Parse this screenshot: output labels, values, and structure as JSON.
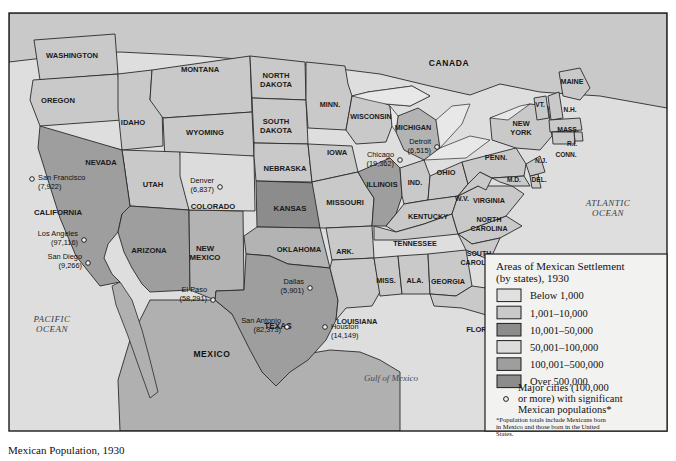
{
  "figure": {
    "caption": "Mexican Population, 1930",
    "bg_color": "#ffffff",
    "map_border_color": "#1d1d1d"
  },
  "map": {
    "countries": [
      {
        "name": "canada",
        "label": "CANADA",
        "x": 449,
        "y": 66,
        "size": 8.5
      },
      {
        "name": "mexico",
        "label": "MEXICO",
        "x": 212,
        "y": 357,
        "size": 8.5
      }
    ],
    "oceans": [
      {
        "name": "pacific-ocean",
        "line1": "PACIFIC",
        "line2": "OCEAN",
        "x": 52,
        "y": 322
      },
      {
        "name": "atlantic-ocean",
        "line1": "ATLANTIC",
        "line2": "OCEAN",
        "x": 608,
        "y": 206
      },
      {
        "name": "gulf-of-mexico",
        "line1": "Gulf of Mexico",
        "line2": "",
        "x": 391,
        "y": 381
      }
    ],
    "states": [
      {
        "id": "WA",
        "label": "WASHINGTON",
        "x": 72,
        "y": 56,
        "size": 7.6,
        "fill": "#c9c9c9",
        "lines": 1
      },
      {
        "id": "OR",
        "label": "OREGON",
        "x": 58,
        "y": 101,
        "size": 7.6,
        "fill": "#c9c9c9",
        "lines": 1
      },
      {
        "id": "ID",
        "label": "IDAHO",
        "x": 133,
        "y": 123,
        "size": 7.6,
        "fill": "#c9c9c9",
        "lines": 1
      },
      {
        "id": "MT",
        "label": "MONTANA",
        "x": 200,
        "y": 70,
        "size": 7.6,
        "fill": "#c9c9c9",
        "lines": 1
      },
      {
        "id": "WY",
        "label": "WYOMING",
        "x": 205,
        "y": 133,
        "size": 7.6,
        "fill": "#c9c9c9",
        "lines": 1
      },
      {
        "id": "NV",
        "label": "NEVADA",
        "x": 101,
        "y": 163,
        "size": 7.6,
        "fill": "#c9c9c9",
        "lines": 1
      },
      {
        "id": "UT",
        "label": "UTAH",
        "x": 153,
        "y": 185,
        "size": 7.6,
        "fill": "#c9c9c9",
        "lines": 1
      },
      {
        "id": "CA",
        "label": "CALIFORNIA",
        "x": 58,
        "y": 213,
        "size": 7.8,
        "fill": "#9e9e9e",
        "lines": 1
      },
      {
        "id": "AZ",
        "label": "ARIZONA",
        "x": 149,
        "y": 251,
        "size": 7.8,
        "fill": "#9e9e9e",
        "lines": 1
      },
      {
        "id": "NM",
        "label": "NEW\nMEXICO",
        "x": 205,
        "y": 253,
        "size": 7.8,
        "fill": "#b3b3b3",
        "lines": 2
      },
      {
        "id": "CO",
        "label": "COLORADO",
        "x": 213,
        "y": 207,
        "size": 7.6,
        "fill": "#dcdcdc",
        "lines": 1
      },
      {
        "id": "ND",
        "label": "NORTH\nDAKOTA",
        "x": 276,
        "y": 80,
        "size": 7.6,
        "fill": "#c9c9c9",
        "lines": 2
      },
      {
        "id": "SD",
        "label": "SOUTH\nDAKOTA",
        "x": 276,
        "y": 126,
        "size": 7.6,
        "fill": "#c9c9c9",
        "lines": 2
      },
      {
        "id": "NE",
        "label": "NEBRASKA",
        "x": 285,
        "y": 169,
        "size": 7.6,
        "fill": "#c9c9c9",
        "lines": 1
      },
      {
        "id": "KS",
        "label": "KANSAS",
        "x": 290,
        "y": 209,
        "size": 7.8,
        "fill": "#8c8c8c",
        "lines": 1
      },
      {
        "id": "OK",
        "label": "OKLAHOMA",
        "x": 299,
        "y": 250,
        "size": 7.6,
        "fill": "#b3b3b3",
        "lines": 1
      },
      {
        "id": "TX",
        "label": "TEXAS",
        "x": 278,
        "y": 327,
        "size": 8.2,
        "fill": "#9e9e9e",
        "lines": 1
      },
      {
        "id": "MN",
        "label": "MINN.",
        "x": 330,
        "y": 105,
        "size": 7.2,
        "fill": "#c9c9c9",
        "lines": 1
      },
      {
        "id": "IA",
        "label": "IOWA",
        "x": 337,
        "y": 153,
        "size": 7.6,
        "fill": "#c9c9c9",
        "lines": 1
      },
      {
        "id": "MO",
        "label": "MISSOURI",
        "x": 345,
        "y": 203,
        "size": 7.6,
        "fill": "#c9c9c9",
        "lines": 1
      },
      {
        "id": "AR",
        "label": "ARK.",
        "x": 345,
        "y": 252,
        "size": 7.2,
        "fill": "#c9c9c9",
        "lines": 1
      },
      {
        "id": "LA",
        "label": "LOUISIANA",
        "x": 357,
        "y": 322,
        "size": 7.4,
        "fill": "#c9c9c9",
        "lines": 1
      },
      {
        "id": "WI",
        "label": "WISCONSIN",
        "x": 371,
        "y": 117,
        "size": 7.2,
        "fill": "#c9c9c9",
        "lines": 1
      },
      {
        "id": "IL",
        "label": "ILLINOIS",
        "x": 382,
        "y": 185,
        "size": 7.4,
        "fill": "#9e9e9e",
        "lines": 1
      },
      {
        "id": "MI",
        "label": "MICHIGAN",
        "x": 413,
        "y": 128,
        "size": 7.2,
        "fill": "#b3b3b3",
        "lines": 1
      },
      {
        "id": "IN",
        "label": "IND.",
        "x": 415,
        "y": 183,
        "size": 7.2,
        "fill": "#c9c9c9",
        "lines": 1
      },
      {
        "id": "OH",
        "label": "OHIO",
        "x": 446,
        "y": 173,
        "size": 7.4,
        "fill": "#c9c9c9",
        "lines": 1
      },
      {
        "id": "KY",
        "label": "KENTUCKY",
        "x": 428,
        "y": 217,
        "size": 7.2,
        "fill": "#c9c9c9",
        "lines": 1
      },
      {
        "id": "TN",
        "label": "TENNESSEE",
        "x": 415,
        "y": 244,
        "size": 7.2,
        "fill": "#c9c9c9",
        "lines": 1
      },
      {
        "id": "MS",
        "label": "MISS.",
        "x": 386,
        "y": 281,
        "size": 7.2,
        "fill": "#c9c9c9",
        "lines": 1
      },
      {
        "id": "AL",
        "label": "ALA.",
        "x": 415,
        "y": 281,
        "size": 7.2,
        "fill": "#c9c9c9",
        "lines": 1
      },
      {
        "id": "GA",
        "label": "GEORGIA",
        "x": 448,
        "y": 282,
        "size": 7.2,
        "fill": "#c9c9c9",
        "lines": 1
      },
      {
        "id": "FL",
        "label": "FLORIDA",
        "x": 483,
        "y": 330,
        "size": 7.6,
        "fill": "#c9c9c9",
        "lines": 1
      },
      {
        "id": "SC",
        "label": "SOUTH\nCAROLINA",
        "x": 479,
        "y": 258,
        "size": 7,
        "fill": "#c9c9c9",
        "lines": 2
      },
      {
        "id": "NC",
        "label": "NORTH\nCAROLINA",
        "x": 489,
        "y": 224,
        "size": 7,
        "fill": "#c9c9c9",
        "lines": 2
      },
      {
        "id": "VA",
        "label": "VIRGINIA",
        "x": 489,
        "y": 201,
        "size": 7.2,
        "fill": "#c9c9c9",
        "lines": 1
      },
      {
        "id": "WV",
        "label": "W.V.",
        "x": 462,
        "y": 199,
        "size": 7,
        "fill": "#c9c9c9",
        "lines": 1
      },
      {
        "id": "PA",
        "label": "PENN.",
        "x": 496,
        "y": 158,
        "size": 7.4,
        "fill": "#c9c9c9",
        "lines": 1
      },
      {
        "id": "MD",
        "label": "M.D.",
        "x": 514,
        "y": 180,
        "size": 6.6,
        "fill": "#c9c9c9",
        "lines": 1
      },
      {
        "id": "DE",
        "label": "DEL.",
        "x": 539,
        "y": 180,
        "size": 6.6,
        "fill": "#c9c9c9",
        "lines": 1
      },
      {
        "id": "NJ",
        "label": "N.J.",
        "x": 541,
        "y": 161,
        "size": 6.6,
        "fill": "#c9c9c9",
        "lines": 1
      },
      {
        "id": "NY",
        "label": "NEW\nYORK",
        "x": 521,
        "y": 128,
        "size": 7.4,
        "fill": "#c9c9c9",
        "lines": 2
      },
      {
        "id": "VT",
        "label": "VT.",
        "x": 540,
        "y": 105,
        "size": 6.6,
        "fill": "#c9c9c9",
        "lines": 1
      },
      {
        "id": "NH",
        "label": "N.H.",
        "x": 570,
        "y": 110,
        "size": 6.6,
        "fill": "#c9c9c9",
        "lines": 1
      },
      {
        "id": "MA",
        "label": "MASS.",
        "x": 568,
        "y": 130,
        "size": 6.8,
        "fill": "#c9c9c9",
        "lines": 1
      },
      {
        "id": "RI",
        "label": "R.I.",
        "x": 572,
        "y": 144,
        "size": 6.4,
        "fill": "#c9c9c9",
        "lines": 1
      },
      {
        "id": "CT",
        "label": "CONN.",
        "x": 566,
        "y": 155,
        "size": 6.6,
        "fill": "#c9c9c9",
        "lines": 1
      },
      {
        "id": "ME",
        "label": "MAINE",
        "x": 572,
        "y": 82,
        "size": 7.2,
        "fill": "#c9c9c9",
        "lines": 1
      }
    ],
    "cities": [
      {
        "name": "san-francisco",
        "label": "San Francisco",
        "value": "(7,922)",
        "mx": 32,
        "my": 179,
        "tx": 38,
        "ty": 180,
        "anchor": "start"
      },
      {
        "name": "los-angeles",
        "label": "Los Angeles",
        "value": "(97,116)",
        "mx": 84,
        "my": 240,
        "tx": 78,
        "ty": 236,
        "anchor": "end"
      },
      {
        "name": "san-diego",
        "label": "San Diego",
        "value": "(9,266)",
        "mx": 88,
        "my": 263,
        "tx": 82,
        "ty": 259,
        "anchor": "end"
      },
      {
        "name": "denver",
        "label": "Denver",
        "value": "(6,837)",
        "mx": 220,
        "my": 187,
        "tx": 214,
        "ty": 183,
        "anchor": "end"
      },
      {
        "name": "el-paso",
        "label": "El Paso",
        "value": "(58,291)",
        "mx": 213,
        "my": 300,
        "tx": 207,
        "ty": 292,
        "anchor": "end"
      },
      {
        "name": "dallas",
        "label": "Dallas",
        "value": "(5,901)",
        "mx": 310,
        "my": 288,
        "tx": 304,
        "ty": 284,
        "anchor": "end"
      },
      {
        "name": "san-antonio",
        "label": "San Antonio",
        "value": "(82,373)",
        "mx": 287,
        "my": 327,
        "tx": 281,
        "ty": 323,
        "anchor": "end"
      },
      {
        "name": "houston",
        "label": "Houston",
        "value": "(14,149)",
        "mx": 325,
        "my": 327,
        "tx": 331,
        "ty": 329,
        "anchor": "start"
      },
      {
        "name": "chicago",
        "label": "Chicago",
        "value": "(19,362)",
        "mx": 400,
        "my": 160,
        "tx": 394,
        "ty": 157,
        "anchor": "end"
      },
      {
        "name": "detroit",
        "label": "Detroit",
        "value": "(6,515)",
        "mx": 437,
        "my": 147,
        "tx": 431,
        "ty": 144,
        "anchor": "end"
      }
    ]
  },
  "legend": {
    "title_line1": "Areas of Mexican Settlement",
    "title_line2": "(by states), 1930",
    "items": [
      {
        "label": "Below 1,000",
        "color": "#e0e0e0"
      },
      {
        "label": "1,001–10,000",
        "color": "#c9c9c9"
      },
      {
        "label": "10,001–50,000",
        "color": "#8c8c8c"
      },
      {
        "label": "50,001–100,000",
        "color": "#dcdcdc"
      },
      {
        "label": "100,001–500,000",
        "color": "#9e9e9e"
      },
      {
        "label": "Over 500,000",
        "color": "#8c8c8c"
      }
    ],
    "city_key_line1": "Major cities (100,000",
    "city_key_line2": "or more) with significant",
    "city_key_line3": "Mexican populations*",
    "note_line1": "*Population totals include Mexicans born",
    "note_line2": "in Mexico and those born in the United",
    "note_line3": "States."
  }
}
